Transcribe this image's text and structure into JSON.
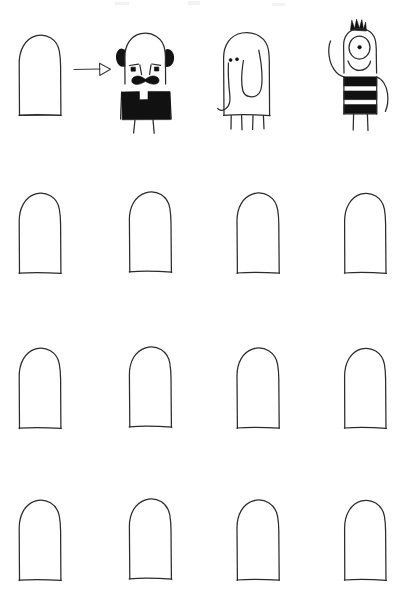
{
  "sheet": {
    "title": "Character doodle worksheet",
    "description": "Hand-drawn worksheet: a blank arch template is transformed into character drawings.",
    "background_color": "#ffffff",
    "ink_color": "#2b2b2b",
    "fill_color": "#111111",
    "width": 409,
    "height": 603,
    "columns": 4,
    "rows": 4,
    "total_cells": 16,
    "blank_template_count": 13,
    "completed_example_count": 3
  },
  "transform_arrow": {
    "name": "arrow-right",
    "label": "",
    "style": "open triangular arrowhead",
    "from_cell": "r1c1",
    "to_cell": "r1c2"
  },
  "grid": {
    "column_x": [
      18,
      128,
      236,
      343
    ],
    "row_y": [
      22,
      182,
      337,
      489
    ],
    "shape_width": 45,
    "shape_height": 88
  },
  "cells": [
    {
      "id": "r1c1",
      "row": 1,
      "column": 1,
      "type": "blank-template",
      "label": "Blank arch template",
      "filled": false
    },
    {
      "id": "r1c2",
      "row": 1,
      "column": 2,
      "type": "character",
      "label": "Bald man with mustache",
      "filled": true,
      "features": [
        "bald tapered head",
        "black ears and sideburns",
        "angled eyebrows",
        "square eyes",
        "thick black mustache",
        "solid black shirt with notched collar",
        "two thin arms",
        "two thin legs"
      ]
    },
    {
      "id": "r1c3",
      "row": 1,
      "column": 3,
      "type": "character",
      "label": "Elephant",
      "filled": true,
      "features": [
        "rounded body",
        "two dot eyes",
        "long curved trunk",
        "large rounded ear",
        "four short legs"
      ]
    },
    {
      "id": "r1c4",
      "row": 1,
      "column": 4,
      "type": "character",
      "label": "Striped cyclops monster",
      "filled": true,
      "features": [
        "black spiky hair tuft",
        "one large round eye with pupil",
        "smiling mouth",
        "black and white striped shirt",
        "raised waving arm",
        "lowered arm",
        "two thin legs"
      ]
    },
    {
      "id": "r2c1",
      "row": 2,
      "column": 1,
      "type": "blank-template",
      "label": "Blank arch template",
      "filled": false
    },
    {
      "id": "r2c2",
      "row": 2,
      "column": 2,
      "type": "blank-template",
      "label": "Blank arch template",
      "filled": false
    },
    {
      "id": "r2c3",
      "row": 2,
      "column": 3,
      "type": "blank-template",
      "label": "Blank arch template",
      "filled": false
    },
    {
      "id": "r2c4",
      "row": 2,
      "column": 4,
      "type": "blank-template",
      "label": "Blank arch template",
      "filled": false
    },
    {
      "id": "r3c1",
      "row": 3,
      "column": 1,
      "type": "blank-template",
      "label": "Blank arch template",
      "filled": false
    },
    {
      "id": "r3c2",
      "row": 3,
      "column": 2,
      "type": "blank-template",
      "label": "Blank arch template",
      "filled": false
    },
    {
      "id": "r3c3",
      "row": 3,
      "column": 3,
      "type": "blank-template",
      "label": "Blank arch template",
      "filled": false
    },
    {
      "id": "r3c4",
      "row": 3,
      "column": 4,
      "type": "blank-template",
      "label": "Blank arch template",
      "filled": false
    },
    {
      "id": "r4c1",
      "row": 4,
      "column": 1,
      "type": "blank-template",
      "label": "Blank arch template",
      "filled": false
    },
    {
      "id": "r4c2",
      "row": 4,
      "column": 2,
      "type": "blank-template",
      "label": "Blank arch template",
      "filled": false
    },
    {
      "id": "r4c3",
      "row": 4,
      "column": 3,
      "type": "blank-template",
      "label": "Blank arch template",
      "filled": false
    },
    {
      "id": "r4c4",
      "row": 4,
      "column": 4,
      "type": "blank-template",
      "label": "Blank arch template",
      "filled": false
    }
  ]
}
